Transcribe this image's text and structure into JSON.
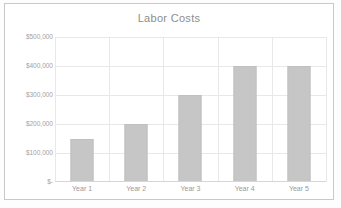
{
  "chart_data": {
    "type": "bar",
    "title": "Labor Costs",
    "categories": [
      "Year 1",
      "Year 2",
      "Year 3",
      "Year 4",
      "Year 5"
    ],
    "values": [
      150000,
      200000,
      300000,
      400000,
      400000
    ],
    "xlabel": "",
    "ylabel": "",
    "ylim": [
      0,
      500000
    ],
    "y_ticks": [
      0,
      100000,
      200000,
      300000,
      400000,
      500000
    ],
    "y_tick_labels": [
      "$-",
      "$100,000",
      "$200,000",
      "$300,000",
      "$400,000",
      "$500,000"
    ],
    "grid": "horizontal-and-vertical",
    "legend": "none",
    "series": [
      {
        "name": "Labor Costs",
        "values": [
          150000,
          200000,
          300000,
          400000,
          400000
        ],
        "color": "#c6c6c6"
      }
    ],
    "colors": {
      "bar_fill": "#c6c6c6",
      "gridline": "#e8e8e8",
      "axis_line": "#d6d6d6",
      "title_text": "#8d8d8d",
      "tick_text": "#a2a2a2",
      "frame_border": "#c9c9c9",
      "plot_background": "#ffffff"
    }
  }
}
